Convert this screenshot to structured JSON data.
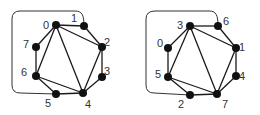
{
  "graphs": [
    {
      "name": "left-graph",
      "nodes": [
        {
          "id": "0",
          "x": 56,
          "y": 25,
          "lx": 43,
          "ly": 29
        },
        {
          "id": "1",
          "x": 84,
          "y": 26,
          "lx": 71,
          "ly": 22
        },
        {
          "id": "2",
          "x": 102,
          "y": 47,
          "lx": 104,
          "ly": 46
        },
        {
          "id": "3",
          "x": 102,
          "y": 77,
          "lx": 104,
          "ly": 75
        },
        {
          "id": "4",
          "x": 83,
          "y": 93,
          "lx": 85,
          "ly": 108
        },
        {
          "id": "5",
          "x": 56,
          "y": 94,
          "lx": 45,
          "ly": 107
        },
        {
          "id": "6",
          "x": 36,
          "y": 76,
          "lx": 21,
          "ly": 76
        },
        {
          "id": "7",
          "x": 36,
          "y": 47,
          "lx": 23,
          "ly": 48
        }
      ],
      "edges": [
        [
          "0",
          "1"
        ],
        [
          "0",
          "2"
        ],
        [
          "0",
          "4"
        ],
        [
          "0",
          "6"
        ],
        [
          "0",
          "7"
        ],
        [
          "1",
          "2"
        ],
        [
          "2",
          "3"
        ],
        [
          "2",
          "4"
        ],
        [
          "3",
          "4"
        ],
        [
          "4",
          "5"
        ],
        [
          "4",
          "6"
        ],
        [
          "5",
          "6"
        ],
        [
          "6",
          "7"
        ]
      ],
      "loop": "M 84 26 C 84 15, 82 11, 75 11 L 20 11 Q 12 11, 12 19 L 12 85 Q 12 93, 20 93 L 56 94"
    },
    {
      "name": "right-graph",
      "nodes": [
        {
          "id": "3",
          "x": 190,
          "y": 26,
          "lx": 177,
          "ly": 29
        },
        {
          "id": "6",
          "x": 218,
          "y": 26,
          "lx": 223,
          "ly": 25
        },
        {
          "id": "1",
          "x": 236,
          "y": 48,
          "lx": 239,
          "ly": 51
        },
        {
          "id": "4",
          "x": 236,
          "y": 76,
          "lx": 239,
          "ly": 80
        },
        {
          "id": "7",
          "x": 217,
          "y": 94,
          "lx": 222,
          "ly": 108
        },
        {
          "id": "2",
          "x": 190,
          "y": 95,
          "lx": 178,
          "ly": 108
        },
        {
          "id": "5",
          "x": 168,
          "y": 77,
          "lx": 155,
          "ly": 78
        },
        {
          "id": "0",
          "x": 168,
          "y": 48,
          "lx": 157,
          "ly": 47
        }
      ],
      "edges": [
        [
          "3",
          "6"
        ],
        [
          "3",
          "1"
        ],
        [
          "3",
          "7"
        ],
        [
          "3",
          "5"
        ],
        [
          "3",
          "0"
        ],
        [
          "6",
          "1"
        ],
        [
          "1",
          "4"
        ],
        [
          "1",
          "7"
        ],
        [
          "4",
          "7"
        ],
        [
          "7",
          "2"
        ],
        [
          "7",
          "5"
        ],
        [
          "2",
          "5"
        ],
        [
          "5",
          "0"
        ]
      ],
      "loop": "M 218 26 C 218 15, 216 11, 209 11 L 155 11 Q 146 11, 146 19 L 146 85 Q 146 93, 154 93 L 190 95"
    }
  ]
}
